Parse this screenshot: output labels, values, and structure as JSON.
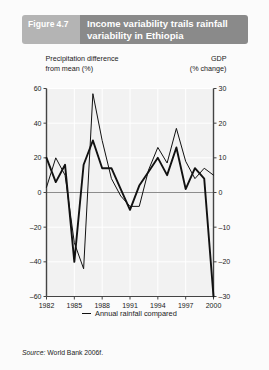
{
  "header": {
    "figure_label": "Figure",
    "figure_number": "4.7",
    "title_line1": "Income variability trails rainfall",
    "title_line2": "variability in Ethiopia",
    "label_bg": "#b4b4b4",
    "title_bg": "#8a8a8a"
  },
  "source": {
    "prefix": "Source:",
    "text": "World Bank 2006f."
  },
  "chart_data": {
    "type": "line",
    "title": "Income variability trails rainfall variability in Ethiopia",
    "xlabel": "",
    "ylabel": "Precipitation difference from mean (%)",
    "y2label": "GDP (% change)",
    "left_axis_title_line1": "Precipitation difference",
    "left_axis_title_line2": "from mean (%)",
    "right_axis_title_line1": "GDP",
    "right_axis_title_line2": "(% change)",
    "xlim": [
      1982,
      2000
    ],
    "ylim": [
      -60,
      60
    ],
    "y2lim": [
      -30,
      30
    ],
    "yticks": [
      60,
      40,
      20,
      0,
      -20,
      -40,
      -60
    ],
    "ytick_labels": [
      "60",
      "40",
      "20",
      "0",
      "–20",
      "–40",
      "–60"
    ],
    "y2ticks": [
      30,
      20,
      10,
      0,
      -10,
      -20,
      -30
    ],
    "y2tick_labels": [
      "30",
      "20",
      "10",
      "0",
      "–10",
      "–20",
      "–30"
    ],
    "xticks": [
      1982,
      1985,
      1988,
      1991,
      1994,
      1997,
      2000
    ],
    "xtick_labels": [
      "1982",
      "1985",
      "1988",
      "1991",
      "1994",
      "1997",
      "2000"
    ],
    "grid": true,
    "legend_position": "below",
    "zero_line": 0,
    "x": [
      1982,
      1983,
      1984,
      1985,
      1986,
      1987,
      1988,
      1989,
      1990,
      1991,
      1992,
      1993,
      1994,
      1995,
      1996,
      1997,
      1998,
      1999,
      2000
    ],
    "series": [
      {
        "name": "Annual rainfall compared with the mean 1982–90",
        "axis": "left",
        "stroke_width": 1.0,
        "color": "#111111",
        "values": [
          3,
          20,
          10,
          -29,
          -44,
          57,
          30,
          8,
          -2,
          -8,
          -8,
          13,
          26,
          17,
          37,
          18,
          8,
          14,
          10
        ]
      },
      {
        "name": "GDP growth",
        "axis": "right",
        "stroke_width": 1.9,
        "color": "#111111",
        "values": [
          10,
          3,
          8,
          -20,
          8,
          15,
          7,
          7,
          1,
          -5,
          2,
          6,
          10,
          5,
          13,
          1,
          7,
          4,
          -30
        ]
      }
    ],
    "legend": [
      {
        "label_line1": "Annual rainfall compared",
        "label_line2": "with the mean 1982–90",
        "stroke_width": 1.0
      },
      {
        "label_line1": "GDP growth",
        "label_line2": "",
        "stroke_width": 2.2
      }
    ]
  }
}
